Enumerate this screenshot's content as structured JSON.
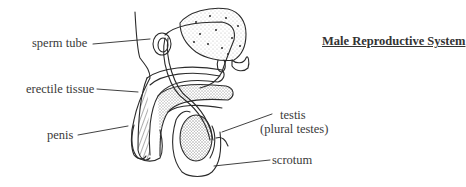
{
  "title": "Male Reproductive System",
  "labels": {
    "sperm_tube": "sperm tube",
    "erectile_tissue": "erectile tissue",
    "penis": "penis",
    "testis": "testis",
    "testis_plural": "(plural testes)",
    "scrotum": "scrotum"
  },
  "colors": {
    "ink": "#2b2b2b",
    "background": "#ffffff"
  }
}
